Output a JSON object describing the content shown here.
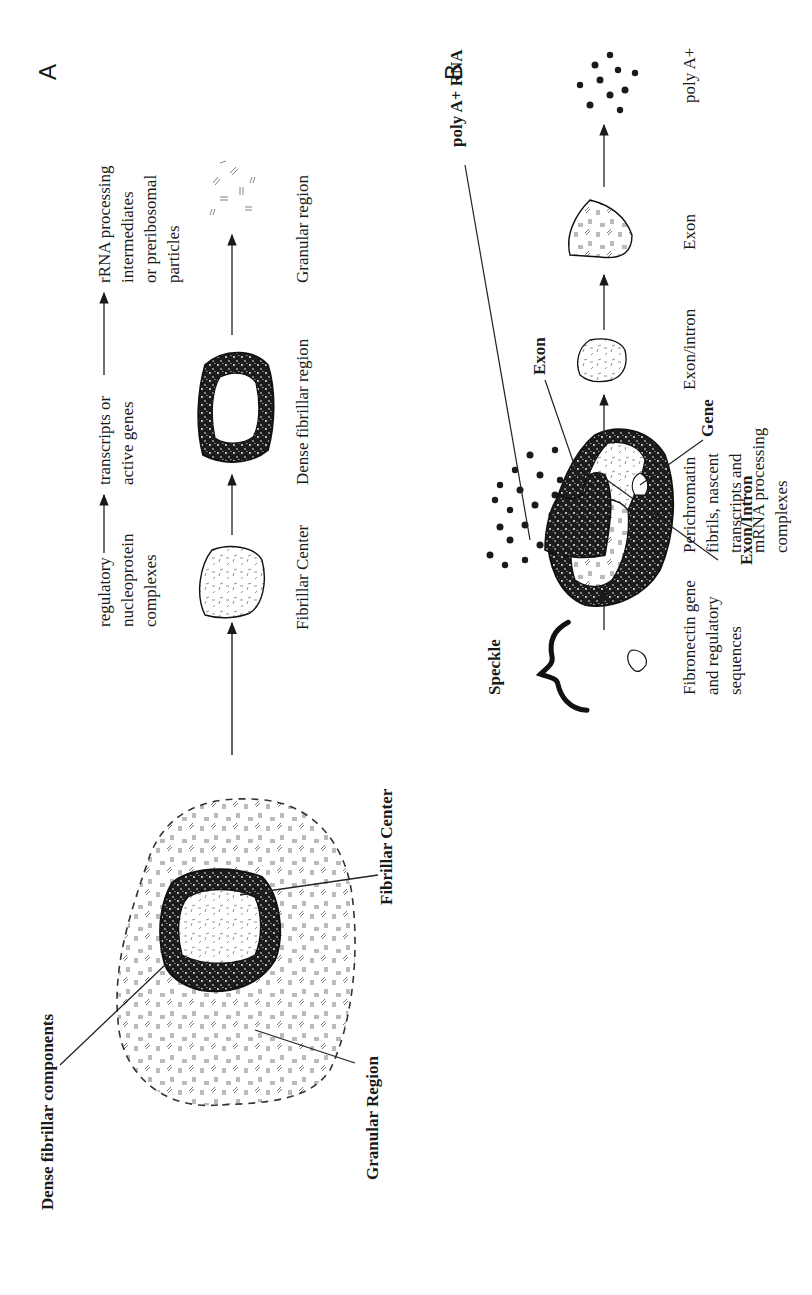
{
  "figure": {
    "orientation": "rotated 90 degrees counterclockwise",
    "panels": [
      {
        "id": "A",
        "label": "A",
        "diagram_labels": {
          "dense_fibrillar_components": "Dense fibrillar components",
          "fibrillar_center": "Fibrillar Center",
          "granular_region": "Granular Region"
        },
        "pathway_top": {
          "steps": [
            [
              "regulatory",
              "nucleoprotein",
              "complexes"
            ],
            [
              "transcripts or",
              "active genes"
            ],
            [
              "rRNA processing",
              "intermediates",
              "or preribosomal",
              "particles"
            ]
          ]
        },
        "pathway_shapes": [
          {
            "name": "fibrillar-center",
            "label": "Fibrillar Center"
          },
          {
            "name": "dense-fibrillar-region",
            "label": "Dense fibrillar region"
          },
          {
            "name": "granular-region",
            "label": "Granular region"
          }
        ]
      },
      {
        "id": "B",
        "label": "B",
        "title": "Speckle",
        "diagram_labels": {
          "poly_a_rna": "poly A+ RNA",
          "exon": "Exon",
          "gene": "Gene",
          "exon_intron": "Exon/Intron"
        },
        "pathway_shapes": [
          {
            "name": "fibronectin-gene",
            "label_lines": [
              "Fibronectin gene",
              "and regulatory",
              "sequences"
            ]
          },
          {
            "name": "perichromatin-fibrils",
            "label_lines": [
              "Perichromatin",
              "fibrils, nascent",
              "transcripts and",
              "mRNA processing",
              "complexes"
            ]
          },
          {
            "name": "exon-intron",
            "label_lines": [
              "Exon/intron"
            ]
          },
          {
            "name": "exon",
            "label_lines": [
              "Exon"
            ]
          },
          {
            "name": "poly-a",
            "label_lines": [
              "poly A+"
            ]
          }
        ]
      }
    ],
    "colors": {
      "ink": "#1a1a1a",
      "background": "#ffffff",
      "stipple": "#777777"
    }
  }
}
